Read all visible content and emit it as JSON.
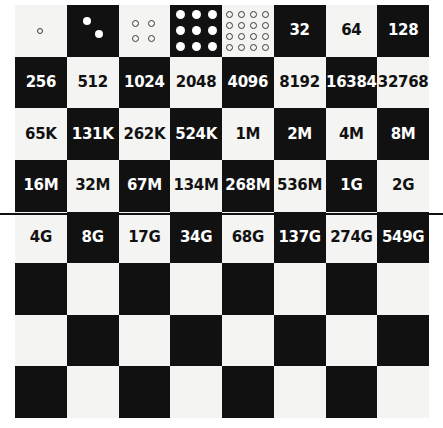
{
  "figure": {
    "name": "chessboard-doubling-grid",
    "columns": 8,
    "rows": 8,
    "colors": {
      "dark_square": "#111111",
      "light_square": "#f4f4f2",
      "divider": "#111111",
      "background": "#ffffff"
    },
    "divider": {
      "visible": true,
      "orientation": "horizontal",
      "y": 213
    }
  },
  "chart_data": {
    "type": "heatmap",
    "title": "",
    "xlabel": "",
    "ylabel": "",
    "grid": true,
    "legend": "none",
    "categories": [
      "a",
      "b",
      "c",
      "d",
      "e",
      "f",
      "g",
      "h"
    ],
    "rows": [
      {
        "index": 1,
        "cells": [
          {
            "col": 1,
            "shade": "light",
            "display": "dots",
            "dots": 1,
            "value": 1
          },
          {
            "col": 2,
            "shade": "dark",
            "display": "dots",
            "dots": 2,
            "value": 2
          },
          {
            "col": 3,
            "shade": "light",
            "display": "dots",
            "dots": 4,
            "value": 4
          },
          {
            "col": 4,
            "shade": "dark",
            "display": "dots",
            "dots": 9,
            "value": 8
          },
          {
            "col": 5,
            "shade": "light",
            "display": "dots",
            "dots": 16,
            "value": 16
          },
          {
            "col": 6,
            "shade": "dark",
            "display": "text",
            "label": "32",
            "value": 32
          },
          {
            "col": 7,
            "shade": "light",
            "display": "text",
            "label": "64",
            "value": 64
          },
          {
            "col": 8,
            "shade": "dark",
            "display": "text",
            "label": "128",
            "value": 128
          }
        ]
      },
      {
        "index": 2,
        "cells": [
          {
            "col": 1,
            "shade": "dark",
            "display": "text",
            "label": "256",
            "value": 256
          },
          {
            "col": 2,
            "shade": "light",
            "display": "text",
            "label": "512",
            "value": 512
          },
          {
            "col": 3,
            "shade": "dark",
            "display": "text",
            "label": "1024",
            "value": 1024
          },
          {
            "col": 4,
            "shade": "light",
            "display": "text",
            "label": "2048",
            "value": 2048
          },
          {
            "col": 5,
            "shade": "dark",
            "display": "text",
            "label": "4096",
            "value": 4096
          },
          {
            "col": 6,
            "shade": "light",
            "display": "text",
            "label": "8192",
            "value": 8192
          },
          {
            "col": 7,
            "shade": "dark",
            "display": "text",
            "label": "16384",
            "value": 16384
          },
          {
            "col": 8,
            "shade": "light",
            "display": "text",
            "label": "32768",
            "value": 32768
          }
        ]
      },
      {
        "index": 3,
        "cells": [
          {
            "col": 1,
            "shade": "light",
            "display": "text",
            "label": "65K",
            "value": 65536
          },
          {
            "col": 2,
            "shade": "dark",
            "display": "text",
            "label": "131K",
            "value": 131072
          },
          {
            "col": 3,
            "shade": "light",
            "display": "text",
            "label": "262K",
            "value": 262144
          },
          {
            "col": 4,
            "shade": "dark",
            "display": "text",
            "label": "524K",
            "value": 524288
          },
          {
            "col": 5,
            "shade": "light",
            "display": "text",
            "label": "1M",
            "value": 1048576
          },
          {
            "col": 6,
            "shade": "dark",
            "display": "text",
            "label": "2M",
            "value": 2097152
          },
          {
            "col": 7,
            "shade": "light",
            "display": "text",
            "label": "4M",
            "value": 4194304
          },
          {
            "col": 8,
            "shade": "dark",
            "display": "text",
            "label": "8M",
            "value": 8388608
          }
        ]
      },
      {
        "index": 4,
        "cells": [
          {
            "col": 1,
            "shade": "dark",
            "display": "text",
            "label": "16M",
            "value": 16777216
          },
          {
            "col": 2,
            "shade": "light",
            "display": "text",
            "label": "32M",
            "value": 33554432
          },
          {
            "col": 3,
            "shade": "dark",
            "display": "text",
            "label": "67M",
            "value": 67108864
          },
          {
            "col": 4,
            "shade": "light",
            "display": "text",
            "label": "134M",
            "value": 134217728
          },
          {
            "col": 5,
            "shade": "dark",
            "display": "text",
            "label": "268M",
            "value": 268435456
          },
          {
            "col": 6,
            "shade": "light",
            "display": "text",
            "label": "536M",
            "value": 536870912
          },
          {
            "col": 7,
            "shade": "dark",
            "display": "text",
            "label": "1G",
            "value": 1073741824
          },
          {
            "col": 8,
            "shade": "light",
            "display": "text",
            "label": "2G",
            "value": 2147483648
          }
        ]
      },
      {
        "index": 5,
        "cells": [
          {
            "col": 1,
            "shade": "light",
            "display": "text",
            "label": "4G",
            "value": 4294967296
          },
          {
            "col": 2,
            "shade": "dark",
            "display": "text",
            "label": "8G",
            "value": 8589934592
          },
          {
            "col": 3,
            "shade": "light",
            "display": "text",
            "label": "17G",
            "value": 17179869184
          },
          {
            "col": 4,
            "shade": "dark",
            "display": "text",
            "label": "34G",
            "value": 34359738368
          },
          {
            "col": 5,
            "shade": "light",
            "display": "text",
            "label": "68G",
            "value": 68719476736
          },
          {
            "col": 6,
            "shade": "dark",
            "display": "text",
            "label": "137G",
            "value": 137438953472
          },
          {
            "col": 7,
            "shade": "light",
            "display": "text",
            "label": "274G",
            "value": 274877906944
          },
          {
            "col": 8,
            "shade": "dark",
            "display": "text",
            "label": "549G",
            "value": 549755813888
          }
        ]
      },
      {
        "index": 6,
        "cells": [
          {
            "col": 1,
            "shade": "dark",
            "display": "empty",
            "label": ""
          },
          {
            "col": 2,
            "shade": "light",
            "display": "empty",
            "label": ""
          },
          {
            "col": 3,
            "shade": "dark",
            "display": "empty",
            "label": ""
          },
          {
            "col": 4,
            "shade": "light",
            "display": "empty",
            "label": ""
          },
          {
            "col": 5,
            "shade": "dark",
            "display": "empty",
            "label": ""
          },
          {
            "col": 6,
            "shade": "light",
            "display": "empty",
            "label": ""
          },
          {
            "col": 7,
            "shade": "dark",
            "display": "empty",
            "label": ""
          },
          {
            "col": 8,
            "shade": "light",
            "display": "empty",
            "label": ""
          }
        ]
      },
      {
        "index": 7,
        "cells": [
          {
            "col": 1,
            "shade": "light",
            "display": "empty",
            "label": ""
          },
          {
            "col": 2,
            "shade": "dark",
            "display": "empty",
            "label": ""
          },
          {
            "col": 3,
            "shade": "light",
            "display": "empty",
            "label": ""
          },
          {
            "col": 4,
            "shade": "dark",
            "display": "empty",
            "label": ""
          },
          {
            "col": 5,
            "shade": "light",
            "display": "empty",
            "label": ""
          },
          {
            "col": 6,
            "shade": "dark",
            "display": "empty",
            "label": ""
          },
          {
            "col": 7,
            "shade": "light",
            "display": "empty",
            "label": ""
          },
          {
            "col": 8,
            "shade": "dark",
            "display": "empty",
            "label": ""
          }
        ]
      },
      {
        "index": 8,
        "cells": [
          {
            "col": 1,
            "shade": "dark",
            "display": "empty",
            "label": ""
          },
          {
            "col": 2,
            "shade": "light",
            "display": "empty",
            "label": ""
          },
          {
            "col": 3,
            "shade": "dark",
            "display": "empty",
            "label": ""
          },
          {
            "col": 4,
            "shade": "light",
            "display": "empty",
            "label": ""
          },
          {
            "col": 5,
            "shade": "dark",
            "display": "empty",
            "label": ""
          },
          {
            "col": 6,
            "shade": "light",
            "display": "empty",
            "label": ""
          },
          {
            "col": 7,
            "shade": "dark",
            "display": "empty",
            "label": ""
          },
          {
            "col": 8,
            "shade": "light",
            "display": "empty",
            "label": ""
          }
        ]
      }
    ]
  }
}
